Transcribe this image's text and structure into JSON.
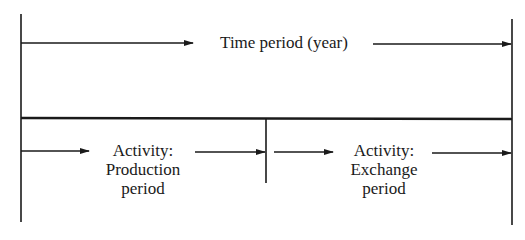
{
  "diagram": {
    "top_span": {
      "label": "Time period (year)"
    },
    "activities": [
      {
        "line1": "Activity:",
        "line2": "Production",
        "line3": "period"
      },
      {
        "line1": "Activity:",
        "line2": "Exchange",
        "line3": "period"
      }
    ],
    "colors": {
      "ink": "#1a1a1a",
      "background": "#ffffff"
    }
  }
}
